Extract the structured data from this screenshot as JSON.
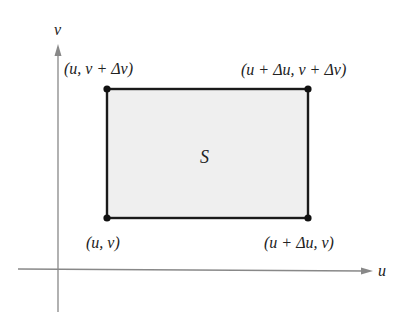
{
  "diagram": {
    "axes": {
      "horizontal_label": "u",
      "vertical_label": "v",
      "axis_color": "#888888"
    },
    "region": {
      "label": "S",
      "fill": "#efefef",
      "stroke": "#1a1a1a"
    },
    "corners": {
      "top_left": "(u, v + Δv)",
      "top_right": "(u + Δu, v + Δv)",
      "bottom_left": "(u, v)",
      "bottom_right": "(u + Δu, v)"
    }
  }
}
